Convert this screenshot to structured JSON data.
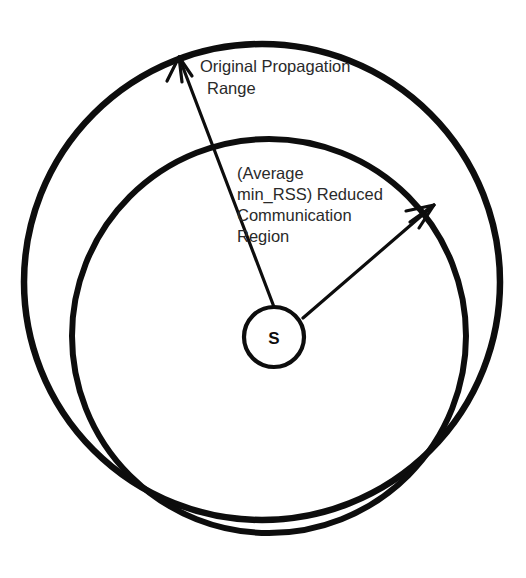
{
  "figure": {
    "background_color": "#ffffff",
    "stroke_color": "#0d0d0d",
    "text_color": "#2a2a2a",
    "width": 526,
    "height": 578
  },
  "node": {
    "label": "S",
    "center_x": 274,
    "center_y": 337,
    "radius": 30
  },
  "regions": {
    "outer": {
      "name": "original-propagation-range",
      "label_lines": [
        "Original Propagation",
        "Range"
      ],
      "label_line_1": "Original Propagation",
      "label_line_2": "Range",
      "center_x": 262,
      "center_y": 282,
      "radius": 238,
      "stroke_width": 6.5
    },
    "inner": {
      "name": "reduced-communication-region",
      "label_lines": [
        "(Average",
        "min_RSS) Reduced",
        "Communication",
        "Region"
      ],
      "label_line_1": "(Average",
      "label_line_2": "min_RSS) Reduced",
      "label_line_3": "Communication",
      "label_line_4": "Region",
      "center_x": 269,
      "center_y": 336,
      "radius": 197,
      "stroke_width": 6
    }
  },
  "arrows": {
    "outer_radius_arrow": {
      "name": "outer-radius-arrow",
      "from_x": 274,
      "from_y": 307,
      "to_x": 177,
      "to_y": 55
    },
    "inner_radius_arrow": {
      "name": "inner-radius-arrow",
      "from_x": 303,
      "from_y": 318,
      "to_x": 434,
      "to_y": 205
    }
  }
}
